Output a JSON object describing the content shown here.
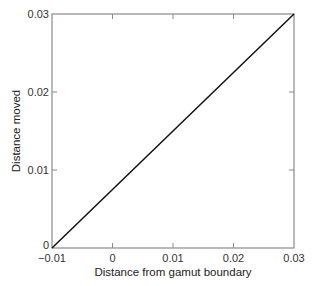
{
  "chart_data": {
    "type": "line",
    "title": "",
    "xlabel": "Distance from gamut boundary",
    "ylabel": "Distance moved",
    "xlim": [
      -0.01,
      0.03
    ],
    "ylim": [
      0,
      0.03
    ],
    "x_ticks": [
      -0.01,
      0,
      0.01,
      0.02,
      0.03
    ],
    "x_tick_labels": [
      "−0.01",
      "0",
      "0.01",
      "0.02",
      "0.03"
    ],
    "y_ticks": [
      0,
      0.01,
      0.02,
      0.03
    ],
    "y_tick_labels": [
      "0",
      "0.01",
      "0.02",
      "0.03"
    ],
    "grid": false,
    "legend": null,
    "series": [
      {
        "name": "mapping",
        "x": [
          -0.01,
          0.03
        ],
        "y": [
          0,
          0.03
        ],
        "color": "#111111"
      }
    ]
  },
  "colors": {
    "frame": "#8a8a8a",
    "line": "#111111",
    "text": "#333333"
  }
}
